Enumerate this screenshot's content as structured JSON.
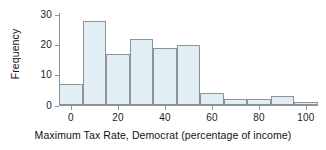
{
  "chart_data": {
    "type": "bar",
    "title": "",
    "subtitle": "",
    "xlabel": "Maximum Tax Rate, Democrat (percentage of income)",
    "ylabel": "Frequency",
    "xlim": [
      -9,
      111
    ],
    "ylim": [
      0,
      31
    ],
    "grid": false,
    "legend": null,
    "bin_width": 10,
    "bin_edges": [
      -5,
      5,
      15,
      25,
      35,
      45,
      55,
      65,
      75,
      85,
      95,
      105
    ],
    "categories": [
      "-5 to 5",
      "5 to 15",
      "15 to 25",
      "25 to 35",
      "35 to 45",
      "45 to 55",
      "55 to 65",
      "65 to 75",
      "75 to 85",
      "85 to 95",
      "95 to 105"
    ],
    "values": [
      7,
      28,
      17,
      22,
      19,
      20,
      4,
      2,
      2,
      3,
      1
    ],
    "xticks": [
      0,
      20,
      40,
      60,
      80,
      100
    ],
    "xtick_labels": [
      "0",
      "20",
      "40",
      "60",
      "80",
      "100"
    ],
    "yticks": [
      0,
      10,
      20,
      30
    ],
    "ytick_labels": [
      "0",
      "10",
      "20",
      "30"
    ],
    "bar_fill_color": "#e1eff5",
    "bar_edge_color": "#8d9397",
    "axis_color": "#8d9397",
    "text_color": "#111111",
    "background_color": "#ffffff"
  }
}
